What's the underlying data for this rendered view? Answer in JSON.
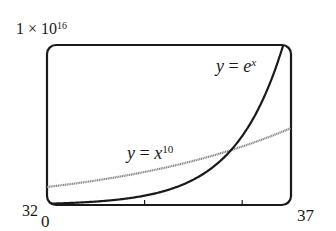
{
  "chart_data": {
    "type": "line",
    "title": "",
    "xlabel": "",
    "ylabel": "",
    "xlim": [
      32,
      37
    ],
    "ylim": [
      0,
      1e+16
    ],
    "x_tick_labels": {
      "min": "32",
      "max": "37"
    },
    "y_tick_labels": {
      "min": "0",
      "max": "1 × 10^16"
    },
    "x_ticks": [
      34,
      36
    ],
    "grid": false,
    "legend": "none (inline curve labels)",
    "annotations": [
      {
        "text": "y = e^x",
        "near_x": 35.8,
        "near_y": 8500000000000000.0
      },
      {
        "text": "y = x^10",
        "near_x": 33.8,
        "near_y": 3000000000000000.0
      }
    ],
    "series": [
      {
        "name": "y = e^x",
        "style": "solid dark",
        "color": "#1a1a1a",
        "x": [
          32,
          33,
          34,
          35,
          35.77,
          36,
          36.5,
          36.84
        ],
        "values": [
          79000000000000.0,
          210000000000000.0,
          580000000000000.0,
          1590000000000000.0,
          3440000000000000.0,
          4310000000000000.0,
          7100000000000000.0,
          1e+16
        ]
      },
      {
        "name": "y = x^10",
        "style": "gray",
        "color": "#8a8a8a",
        "x": [
          32,
          33,
          34,
          35,
          35.77,
          36,
          37
        ],
        "values": [
          1130000000000000.0,
          1530000000000000.0,
          2060000000000000.0,
          2760000000000000.0,
          3440000000000000.0,
          3660000000000000.0,
          4810000000000000.0
        ]
      }
    ],
    "intersection": {
      "x": 35.77,
      "y": 3440000000000000.0
    }
  },
  "labels": {
    "ymax_base": "1 × 10",
    "ymax_exp": "16",
    "ymin": "0",
    "xmin": "32",
    "xmax": "37",
    "ex_y": "y",
    "ex_eq": " = ",
    "ex_base": "e",
    "ex_exp": "x",
    "x10_y": "y",
    "x10_eq": " = ",
    "x10_base": "x",
    "x10_exp": "10"
  },
  "colors": {
    "frame": "#1a1a1a",
    "ex_curve": "#1a1a1a",
    "x10_curve": "#8a8a8a"
  }
}
